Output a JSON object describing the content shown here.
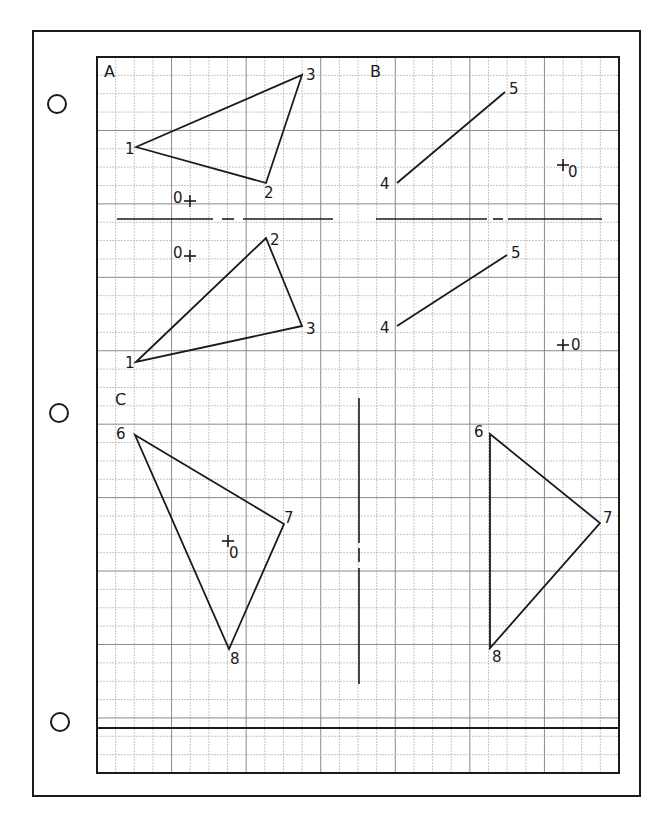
{
  "sheet": {
    "outer_border": {
      "x": 33,
      "y": 31,
      "w": 607,
      "h": 765
    },
    "holes": [
      {
        "cx": 57,
        "cy": 104,
        "r": 9
      },
      {
        "cx": 59,
        "cy": 413,
        "r": 9
      },
      {
        "cx": 60,
        "cy": 722,
        "r": 9
      }
    ],
    "grid": {
      "x": 97,
      "y": 57,
      "w": 522,
      "h": 716,
      "cols": 28,
      "rows": 39,
      "major_every": 4,
      "minor_color": "#b8b8b8",
      "major_color": "#8a8a8a"
    },
    "bottom_rule_y": 728,
    "ink_color": "#1a1a1a"
  },
  "section_labels": [
    {
      "text": "A",
      "x": 104,
      "y": 77
    },
    {
      "text": "B",
      "x": 370,
      "y": 77
    },
    {
      "text": "C",
      "x": 115,
      "y": 405
    }
  ],
  "mirror_lines": {
    "horizontal": [
      {
        "x1": 117,
        "x2": 213,
        "y": 219
      },
      {
        "x1": 222,
        "x2": 234,
        "y": 219
      },
      {
        "x1": 243,
        "x2": 333,
        "y": 219
      },
      {
        "x1": 376,
        "x2": 487,
        "y": 219
      },
      {
        "x1": 493,
        "x2": 503,
        "y": 219
      },
      {
        "x1": 508,
        "x2": 602,
        "y": 219
      }
    ],
    "vertical": [
      {
        "x": 359,
        "y1": 398,
        "y2": 543
      },
      {
        "x": 359,
        "y1": 548,
        "y2": 562
      },
      {
        "x": 359,
        "y1": 568,
        "y2": 684
      }
    ]
  },
  "shapes": [
    {
      "name": "triangle-A-original",
      "type": "polygon",
      "points": [
        {
          "label": "1",
          "x": 136,
          "y": 147,
          "lx": 125,
          "ly": 154
        },
        {
          "label": "2",
          "x": 266,
          "y": 183,
          "lx": 264,
          "ly": 198
        },
        {
          "label": "3",
          "x": 302,
          "y": 75,
          "lx": 306,
          "ly": 80
        }
      ]
    },
    {
      "name": "triangle-A-image",
      "type": "polygon",
      "points": [
        {
          "label": "1",
          "x": 136,
          "y": 362,
          "lx": 125,
          "ly": 368
        },
        {
          "label": "2",
          "x": 266,
          "y": 238,
          "lx": 270,
          "ly": 245
        },
        {
          "label": "3",
          "x": 302,
          "y": 326,
          "lx": 306,
          "ly": 334
        }
      ]
    },
    {
      "name": "segment-B-original",
      "type": "polyline",
      "points": [
        {
          "label": "4",
          "x": 397,
          "y": 183,
          "lx": 380,
          "ly": 189
        },
        {
          "label": "5",
          "x": 505,
          "y": 92,
          "lx": 509,
          "ly": 94
        }
      ]
    },
    {
      "name": "segment-B-image",
      "type": "polyline",
      "points": [
        {
          "label": "4",
          "x": 397,
          "y": 326,
          "lx": 380,
          "ly": 333
        },
        {
          "label": "5",
          "x": 507,
          "y": 255,
          "lx": 511,
          "ly": 258
        }
      ]
    },
    {
      "name": "triangle-C-original",
      "type": "polygon",
      "points": [
        {
          "label": "6",
          "x": 135,
          "y": 435,
          "lx": 116,
          "ly": 439
        },
        {
          "label": "7",
          "x": 284,
          "y": 524,
          "lx": 284,
          "ly": 523
        },
        {
          "label": "8",
          "x": 229,
          "y": 649,
          "lx": 230,
          "ly": 664
        }
      ]
    },
    {
      "name": "triangle-C-image",
      "type": "polygon",
      "points": [
        {
          "label": "6",
          "x": 490,
          "y": 434,
          "lx": 474,
          "ly": 437
        },
        {
          "label": "7",
          "x": 600,
          "y": 523,
          "lx": 603,
          "ly": 523
        },
        {
          "label": "8",
          "x": 490,
          "y": 648,
          "lx": 492,
          "ly": 662
        }
      ]
    }
  ],
  "centers": [
    {
      "label": "0",
      "cx": 190,
      "cy": 201,
      "lx": 173,
      "ly": 203
    },
    {
      "label": "0",
      "cx": 190,
      "cy": 256,
      "lx": 173,
      "ly": 258
    },
    {
      "label": "0",
      "cx": 563,
      "cy": 165,
      "lx": 568,
      "ly": 177
    },
    {
      "label": "0",
      "cx": 563,
      "cy": 345,
      "lx": 571,
      "ly": 350
    },
    {
      "label": "0",
      "cx": 228,
      "cy": 541,
      "lx": 229,
      "ly": 558
    }
  ]
}
